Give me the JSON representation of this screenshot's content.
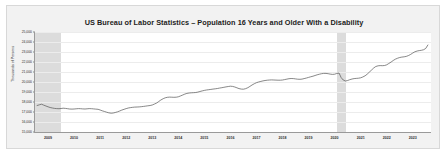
{
  "chart_data": {
    "type": "line",
    "title": "US Bureau of Labor Statistics – Population 16 Years and Older With a Disability",
    "xlabel": "",
    "ylabel": "Thousands of Persons",
    "ylim": [
      15000,
      25000
    ],
    "ytick_labels": [
      "15,000",
      "16,000",
      "17,000",
      "18,000",
      "19,000",
      "20,000",
      "21,000",
      "22,000",
      "23,000",
      "24,000",
      "25,000"
    ],
    "ytick_values": [
      15000,
      16000,
      17000,
      18000,
      19000,
      20000,
      21000,
      22000,
      23000,
      24000,
      25000
    ],
    "xtick_labels": [
      "2009",
      "2010",
      "2011",
      "2012",
      "2013",
      "2014",
      "2015",
      "2016",
      "2017",
      "2018",
      "2019",
      "2020",
      "2021",
      "2022",
      "2023"
    ],
    "xtick_values": [
      2009,
      2010,
      2011,
      2012,
      2013,
      2014,
      2015,
      2016,
      2017,
      2018,
      2019,
      2020,
      2021,
      2022,
      2023
    ],
    "xlim": [
      2008.5,
      2023.7
    ],
    "grid": true,
    "legend": "none",
    "line_color": "#555555",
    "shaded_regions": [
      {
        "label": "recession-2009",
        "start": 2008.5,
        "end": 2009.5,
        "color": "#dcdcdc"
      },
      {
        "label": "recession-2020",
        "start": 2020.1,
        "end": 2020.42,
        "color": "#dcdcdc"
      }
    ],
    "series": [
      {
        "name": "Population 16 Years and Older With a Disability",
        "x": [
          2008.58,
          2008.67,
          2008.75,
          2008.83,
          2008.92,
          2009.0,
          2009.08,
          2009.17,
          2009.25,
          2009.33,
          2009.42,
          2009.5,
          2009.58,
          2009.67,
          2009.75,
          2009.83,
          2009.92,
          2010.0,
          2010.08,
          2010.17,
          2010.25,
          2010.33,
          2010.42,
          2010.5,
          2010.58,
          2010.67,
          2010.75,
          2010.83,
          2010.92,
          2011.0,
          2011.08,
          2011.17,
          2011.25,
          2011.33,
          2011.42,
          2011.5,
          2011.58,
          2011.67,
          2011.75,
          2011.83,
          2011.92,
          2012.0,
          2012.08,
          2012.17,
          2012.25,
          2012.33,
          2012.42,
          2012.5,
          2012.58,
          2012.67,
          2012.75,
          2012.83,
          2012.92,
          2013.0,
          2013.08,
          2013.17,
          2013.25,
          2013.33,
          2013.42,
          2013.5,
          2013.58,
          2013.67,
          2013.75,
          2013.83,
          2013.92,
          2014.0,
          2014.08,
          2014.17,
          2014.25,
          2014.33,
          2014.42,
          2014.5,
          2014.58,
          2014.67,
          2014.75,
          2014.83,
          2014.92,
          2015.0,
          2015.08,
          2015.17,
          2015.25,
          2015.33,
          2015.42,
          2015.5,
          2015.58,
          2015.67,
          2015.75,
          2015.83,
          2015.92,
          2016.0,
          2016.08,
          2016.17,
          2016.25,
          2016.33,
          2016.42,
          2016.5,
          2016.58,
          2016.67,
          2016.75,
          2016.83,
          2016.92,
          2017.0,
          2017.08,
          2017.17,
          2017.25,
          2017.33,
          2017.42,
          2017.5,
          2017.58,
          2017.67,
          2017.75,
          2017.83,
          2017.92,
          2018.0,
          2018.08,
          2018.17,
          2018.25,
          2018.33,
          2018.42,
          2018.5,
          2018.58,
          2018.67,
          2018.75,
          2018.83,
          2018.92,
          2019.0,
          2019.08,
          2019.17,
          2019.25,
          2019.33,
          2019.42,
          2019.5,
          2019.58,
          2019.67,
          2019.75,
          2019.83,
          2019.92,
          2020.0,
          2020.08,
          2020.17,
          2020.25,
          2020.33,
          2020.42,
          2020.5,
          2020.58,
          2020.67,
          2020.75,
          2020.83,
          2020.92,
          2021.0,
          2021.08,
          2021.17,
          2021.25,
          2021.33,
          2021.42,
          2021.5,
          2021.58,
          2021.67,
          2021.75,
          2021.83,
          2021.92,
          2022.0,
          2022.08,
          2022.17,
          2022.25,
          2022.33,
          2022.42,
          2022.5,
          2022.58,
          2022.67,
          2022.75,
          2022.83,
          2022.92,
          2023.0,
          2023.08,
          2023.17,
          2023.25,
          2023.33,
          2023.42,
          2023.5,
          2023.58
        ],
        "values": [
          17650,
          17720,
          17780,
          17690,
          17600,
          17520,
          17450,
          17400,
          17360,
          17340,
          17330,
          17350,
          17380,
          17360,
          17330,
          17300,
          17290,
          17300,
          17320,
          17340,
          17330,
          17310,
          17300,
          17320,
          17340,
          17330,
          17310,
          17290,
          17270,
          17200,
          17120,
          17050,
          16980,
          16920,
          16880,
          16900,
          16950,
          17020,
          17100,
          17190,
          17270,
          17340,
          17400,
          17440,
          17470,
          17490,
          17500,
          17510,
          17530,
          17560,
          17590,
          17620,
          17650,
          17700,
          17790,
          17900,
          18050,
          18200,
          18330,
          18420,
          18470,
          18490,
          18480,
          18470,
          18480,
          18520,
          18600,
          18700,
          18790,
          18860,
          18900,
          18920,
          18930,
          18950,
          18990,
          19050,
          19110,
          19160,
          19200,
          19230,
          19260,
          19290,
          19320,
          19350,
          19390,
          19430,
          19470,
          19510,
          19550,
          19580,
          19560,
          19500,
          19420,
          19340,
          19290,
          19280,
          19330,
          19430,
          19560,
          19700,
          19830,
          19930,
          20000,
          20060,
          20110,
          20150,
          20180,
          20200,
          20210,
          20200,
          20190,
          20180,
          20180,
          20200,
          20240,
          20290,
          20330,
          20350,
          20340,
          20310,
          20280,
          20270,
          20290,
          20340,
          20400,
          20460,
          20520,
          20580,
          20650,
          20720,
          20780,
          20830,
          20860,
          20860,
          20830,
          20790,
          20760,
          20780,
          20850,
          20900,
          20450,
          20200,
          20100,
          20150,
          20230,
          20300,
          20340,
          20360,
          20380,
          20420,
          20500,
          20620,
          20780,
          20980,
          21200,
          21400,
          21550,
          21620,
          21640,
          21630,
          21650,
          21720,
          21850,
          22000,
          22150,
          22280,
          22380,
          22450,
          22490,
          22520,
          22560,
          22640,
          22760,
          22900,
          23020,
          23100,
          23140,
          23170,
          23230,
          23360,
          23700
        ]
      }
    ]
  }
}
